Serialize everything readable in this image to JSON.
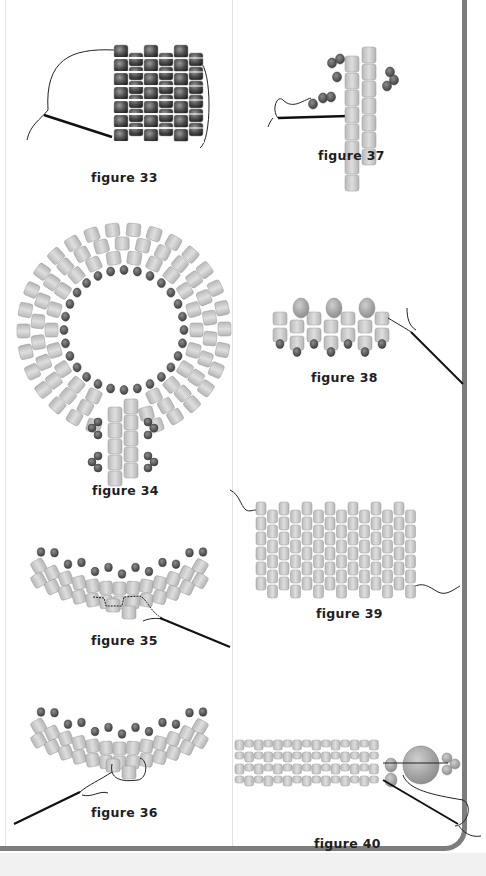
{
  "page": {
    "layout": "two-column beadwork figure page",
    "colors": {
      "frame": "#7d7d7d",
      "bead_dark": "#555555",
      "bead_light": "#c8c8c8",
      "thread": "#222222",
      "background": "#ffffff"
    }
  },
  "figures": [
    {
      "id": "33",
      "caption": "figure 33",
      "description": "tube of dark beads stitched with needle and thread"
    },
    {
      "id": "34",
      "caption": "figure 34",
      "description": "ring of light cylinder beads with dark seed beads on inner edge and a stem"
    },
    {
      "id": "35",
      "caption": "figure 35",
      "description": "curved band of light beads with dark picot beads, needle exiting"
    },
    {
      "id": "36",
      "caption": "figure 36",
      "description": "curved band of light beads with dark beads, thread loop and needle"
    },
    {
      "id": "37",
      "caption": "figure 37",
      "description": "two-column ladder of light beads with dark bead clusters and needle"
    },
    {
      "id": "38",
      "caption": "figure 38",
      "description": "row of light beads with large round beads above and small beads below, needle"
    },
    {
      "id": "39",
      "caption": "figure 39",
      "description": "flat peyote panel of light cylinder beads with thread tails"
    },
    {
      "id": "40",
      "caption": "figure 40",
      "description": "strap of beads ending with large round bead and small cluster, needle"
    }
  ]
}
